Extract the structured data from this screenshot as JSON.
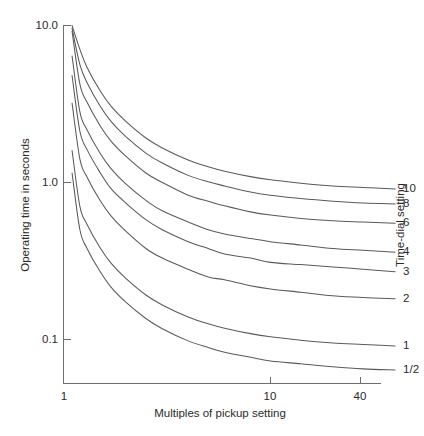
{
  "chart_data": {
    "type": "line",
    "title": "",
    "subtitle": "",
    "xlabel": "Multiples of pickup setting",
    "ylabel": "Operating time in seconds",
    "legend_title": "Time-dial setting",
    "legend_position": "right-inline-end-labels",
    "xscale": "log",
    "yscale": "log",
    "xlim": [
      1,
      40
    ],
    "ylim": [
      0.06,
      10.0
    ],
    "grid": false,
    "xticks": [
      1,
      10,
      40
    ],
    "xtick_labels": [
      "1",
      "10",
      "40"
    ],
    "yticks": [
      10.0,
      1.0,
      0.1
    ],
    "ytick_labels": [
      "10.0",
      "1.0",
      "0.1"
    ],
    "x": [
      1.1,
      1.2,
      1.3,
      1.5,
      1.7,
      2.0,
      2.5,
      3.0,
      4.0,
      5.0,
      6.0,
      8.0,
      10.0,
      14.0,
      20.0,
      28.0,
      40.0
    ],
    "series": [
      {
        "name": "10",
        "label": "10",
        "time_dial": 10,
        "values": [
          10.0,
          7.05,
          5.4,
          3.85,
          3.05,
          2.45,
          1.92,
          1.66,
          1.39,
          1.26,
          1.18,
          1.09,
          1.04,
          0.99,
          0.95,
          0.93,
          0.91
        ]
      },
      {
        "name": "8",
        "label": "8",
        "time_dial": 8,
        "values": [
          9.6,
          5.64,
          4.32,
          3.08,
          2.44,
          1.96,
          1.54,
          1.33,
          1.11,
          1.01,
          0.95,
          0.87,
          0.83,
          0.79,
          0.76,
          0.74,
          0.73
        ]
      },
      {
        "name": "6",
        "label": "6",
        "time_dial": 6,
        "values": [
          9.2,
          4.23,
          3.24,
          2.31,
          1.83,
          1.47,
          1.15,
          1.0,
          0.83,
          0.76,
          0.71,
          0.65,
          0.62,
          0.59,
          0.57,
          0.56,
          0.55
        ]
      },
      {
        "name": "4",
        "label": "4",
        "time_dial": 4,
        "values": [
          6.4,
          2.82,
          2.16,
          1.54,
          1.22,
          0.98,
          0.77,
          0.66,
          0.56,
          0.5,
          0.47,
          0.44,
          0.42,
          0.4,
          0.38,
          0.37,
          0.36
        ]
      },
      {
        "name": "3",
        "label": "3",
        "time_dial": 3,
        "values": [
          4.8,
          2.12,
          1.62,
          1.16,
          0.91,
          0.74,
          0.58,
          0.5,
          0.42,
          0.38,
          0.35,
          0.33,
          0.31,
          0.3,
          0.29,
          0.28,
          0.27
        ]
      },
      {
        "name": "2",
        "label": "2",
        "time_dial": 2,
        "values": [
          3.2,
          1.41,
          1.08,
          0.77,
          0.61,
          0.49,
          0.38,
          0.33,
          0.28,
          0.25,
          0.24,
          0.22,
          0.21,
          0.2,
          0.19,
          0.185,
          0.182
        ]
      },
      {
        "name": "1",
        "label": "1",
        "time_dial": 1,
        "values": [
          1.6,
          0.705,
          0.54,
          0.385,
          0.305,
          0.245,
          0.192,
          0.166,
          0.139,
          0.126,
          0.118,
          0.109,
          0.104,
          0.099,
          0.095,
          0.093,
          0.091
        ]
      },
      {
        "name": "1/2",
        "label": "1/2",
        "time_dial": 0.5,
        "values": [
          1.15,
          0.5,
          0.38,
          0.272,
          0.215,
          0.173,
          0.136,
          0.117,
          0.098,
          0.089,
          0.083,
          0.077,
          0.073,
          0.07,
          0.067,
          0.065,
          0.064
        ]
      }
    ],
    "annotations": []
  },
  "axes": {
    "y_title": "Operating time in seconds",
    "x_title": "Multiples of pickup setting",
    "right_title": "Time-dial setting"
  },
  "colors": {
    "curve": "#5a5a5a",
    "axis": "#6e6e6e",
    "text": "#2a2a2a",
    "background": "#ffffff"
  }
}
